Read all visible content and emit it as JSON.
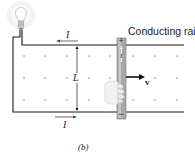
{
  "figure": {
    "caption": "(b)",
    "rail_label": "Conducting rail",
    "current_top_label": "I",
    "current_bottom_label": "I",
    "current_rod_label": "I",
    "length_label": "L",
    "velocity_label": "v",
    "rod_top_sign": "+",
    "rod_bottom_sign": "−",
    "field_symbol": "×"
  },
  "colors": {
    "wire": "#1a1a1a",
    "rod": "#9a9a9a",
    "field_marker": "#9a9a9a",
    "bulb_glow": "#f0f0f0"
  }
}
